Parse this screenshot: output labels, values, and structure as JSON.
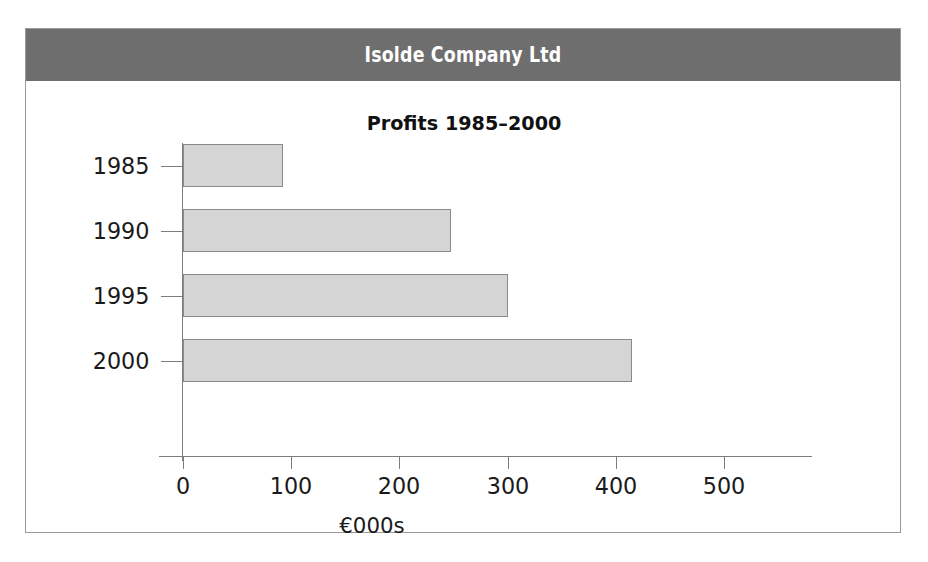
{
  "banner": {
    "title": "Isolde Company Ltd",
    "background_color": "#6e6e6e",
    "text_color": "#ffffff"
  },
  "frame": {
    "border_color": "#9a9a9a",
    "background_color": "#ffffff"
  },
  "chart_data": {
    "type": "bar",
    "orientation": "horizontal",
    "title": "Profits 1985–2000",
    "categories": [
      "1985",
      "1990",
      "1995",
      "2000"
    ],
    "values": [
      92,
      248,
      300,
      415
    ],
    "series": [
      {
        "name": "Profits",
        "values": [
          92,
          248,
          300,
          415
        ]
      }
    ],
    "xlabel": "€000s",
    "ylabel": "",
    "xlim": [
      0,
      540
    ],
    "xticks": [
      0,
      100,
      200,
      300,
      400,
      500
    ],
    "xtick_labels": [
      "0",
      "100",
      "200",
      "300",
      "400",
      "500"
    ],
    "grid": false,
    "legend": false,
    "bar_fill_color": "#d5d5d5",
    "bar_border_color": "#8a8a8a",
    "axis_color": "#7d7d7d",
    "text_color": "#1a1a1a"
  }
}
